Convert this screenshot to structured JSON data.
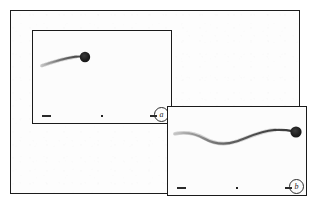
{
  "figure": {
    "background_color": "#ffffff",
    "frame_color": "#1c1c1c",
    "panel_background": "#fcfcfc",
    "ink_color": "#2a2a2a",
    "bead_color": "#1a1a1a"
  },
  "panels": [
    {
      "id": "panel-a",
      "label": "a",
      "label_shape": "circled",
      "specimen": "bead-attached filament",
      "filament_shape": "gently arched tapering filament",
      "bead": {
        "cx": 52,
        "cy": 26,
        "r": 5.2
      },
      "marks": {
        "scale_bar_left": "scale-bar",
        "center_tick": "tick-dot",
        "scale_bar_right": "scale-bar"
      }
    },
    {
      "id": "panel-b",
      "label": "b",
      "label_shape": "circled",
      "specimen": "bead-attached filament",
      "filament_shape": "wavy S-shaped filament",
      "bead": {
        "cx": 128,
        "cy": 25,
        "r": 5.6
      },
      "marks": {
        "scale_bar_left": "scale-bar",
        "center_tick": "tick-dot",
        "scale_bar_right": "scale-bar"
      }
    }
  ]
}
